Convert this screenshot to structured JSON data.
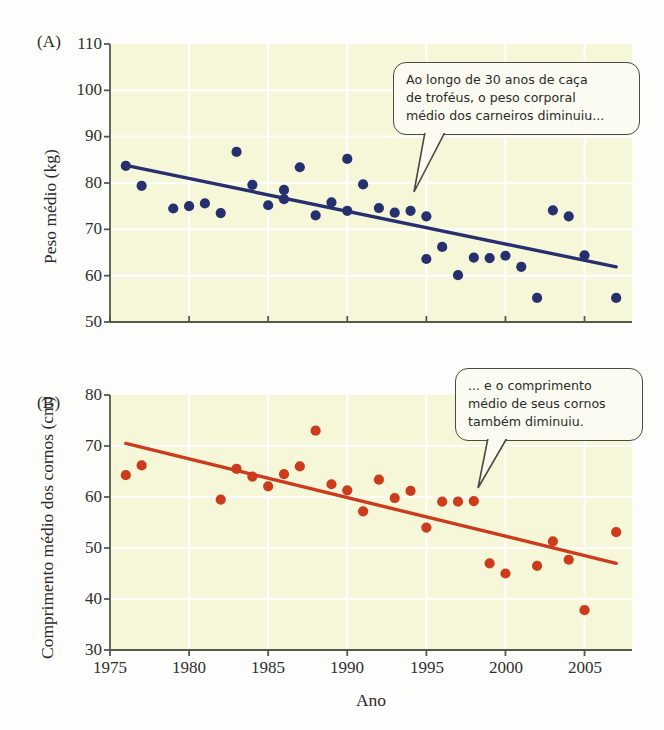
{
  "figure": {
    "background_color": "#fdfdfb",
    "plot_background_color": "#f6f7d9",
    "grid_color": "#ffffff",
    "axis_color": "#58584a",
    "xlabel": "Ano"
  },
  "panels": {
    "a": {
      "letter": "(A)",
      "ylabel": "Peso médio (kg)",
      "point_color": "#26306f",
      "line_color": "#26306f",
      "callout": {
        "lines": [
          "Ao longo de 30 anos de caça",
          "de troféus, o peso corporal",
          "médio dos carneiros diminuiu..."
        ]
      }
    },
    "b": {
      "letter": "(B)",
      "ylabel": "Comprimento médio dos cornos (cm)",
      "point_color": "#cc3c1c",
      "line_color": "#cc3c1c",
      "callout": {
        "lines": [
          "... e o comprimento",
          "médio de seus cornos",
          "também diminuiu."
        ]
      }
    }
  },
  "chart_data": [
    {
      "type": "scatter",
      "panel": "A",
      "title": "",
      "xlabel": "Ano",
      "ylabel": "Peso médio (kg)",
      "xlim": [
        1975,
        2008
      ],
      "ylim": [
        50,
        110
      ],
      "xticks": [
        1975,
        1980,
        1985,
        1990,
        1995,
        2000,
        2005
      ],
      "yticks": [
        50,
        60,
        70,
        80,
        90,
        100,
        110
      ],
      "grid": true,
      "legend": "none",
      "point_color": "#26306f",
      "x": [
        1976,
        1977,
        1979,
        1980,
        1981,
        1982,
        1983,
        1984,
        1985,
        1986,
        1986,
        1987,
        1988,
        1989,
        1990,
        1990,
        1991,
        1992,
        1993,
        1994,
        1995,
        1995,
        1996,
        1997,
        1998,
        1999,
        2000,
        2001,
        2002,
        2003,
        2004,
        2005,
        2007
      ],
      "y": [
        83.7,
        79.4,
        74.5,
        75.0,
        75.6,
        73.5,
        86.7,
        79.6,
        75.2,
        76.5,
        78.5,
        83.4,
        73.0,
        75.8,
        74.0,
        85.2,
        79.7,
        74.6,
        73.6,
        74.0,
        63.6,
        72.8,
        66.2,
        60.1,
        63.9,
        63.8,
        64.3,
        61.9,
        55.2,
        74.1,
        72.8,
        64.4,
        55.2
      ],
      "trendline": {
        "type": "linear",
        "x": [
          1976,
          2007
        ],
        "y": [
          83.8,
          61.9
        ]
      }
    },
    {
      "type": "scatter",
      "panel": "B",
      "title": "",
      "xlabel": "Ano",
      "ylabel": "Comprimento médio dos cornos (cm)",
      "xlim": [
        1975,
        2008
      ],
      "ylim": [
        30,
        80
      ],
      "xticks": [
        1975,
        1980,
        1985,
        1990,
        1995,
        2000,
        2005
      ],
      "yticks": [
        30,
        40,
        50,
        60,
        70,
        80
      ],
      "grid": true,
      "legend": "none",
      "point_color": "#cc3c1c",
      "x": [
        1976,
        1977,
        1982,
        1983,
        1984,
        1985,
        1986,
        1987,
        1988,
        1989,
        1990,
        1991,
        1992,
        1993,
        1994,
        1995,
        1996,
        1997,
        1998,
        1999,
        2000,
        2002,
        2003,
        2004,
        2005,
        2007
      ],
      "y": [
        64.3,
        66.2,
        59.5,
        65.5,
        64.0,
        62.1,
        64.5,
        66.0,
        73.0,
        62.5,
        61.3,
        57.2,
        63.4,
        59.8,
        61.2,
        54.0,
        59.1,
        59.1,
        59.2,
        47.0,
        45.0,
        46.5,
        51.3,
        47.7,
        37.8,
        53.1
      ],
      "trendline": {
        "type": "linear",
        "x": [
          1976,
          2007
        ],
        "y": [
          70.5,
          47.0
        ]
      }
    }
  ]
}
